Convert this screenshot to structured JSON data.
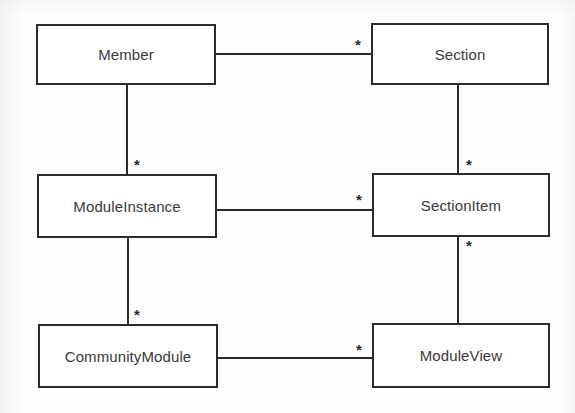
{
  "diagram": {
    "type": "uml-class-diagram",
    "background_color": "#fdfdfc",
    "line_color": "#2b2b2b",
    "text_color": "#3a3a3a",
    "classes": [
      {
        "id": "member",
        "name": "Member",
        "x": 36,
        "y": 24,
        "width": 180,
        "height": 61
      },
      {
        "id": "section",
        "name": "Section",
        "x": 371,
        "y": 23,
        "width": 178,
        "height": 62
      },
      {
        "id": "moduleinstance",
        "name": "ModuleInstance",
        "x": 37,
        "y": 174,
        "width": 180,
        "height": 64
      },
      {
        "id": "sectionitem",
        "name": "SectionItem",
        "x": 372,
        "y": 173,
        "width": 178,
        "height": 64
      },
      {
        "id": "communitymodule",
        "name": "CommunityModule",
        "x": 38,
        "y": 324,
        "width": 180,
        "height": 64
      },
      {
        "id": "moduleview",
        "name": "ModuleView",
        "x": 372,
        "y": 323,
        "width": 178,
        "height": 65
      }
    ],
    "associations": [
      {
        "id": "member-section",
        "from": "member",
        "to": "section",
        "orientation": "horizontal",
        "x": 216,
        "y": 53,
        "length": 156,
        "multiplicity_label": "*",
        "multiplicity_x": 358,
        "multiplicity_y": 44
      },
      {
        "id": "member-moduleinstance",
        "from": "member",
        "to": "moduleinstance",
        "orientation": "vertical",
        "x": 126,
        "y": 85,
        "length": 90,
        "multiplicity_label": "*",
        "multiplicity_x": 137,
        "multiplicity_y": 164
      },
      {
        "id": "section-sectionitem",
        "from": "section",
        "to": "sectionitem",
        "orientation": "vertical",
        "x": 457,
        "y": 85,
        "length": 89,
        "multiplicity_label": "*",
        "multiplicity_x": 469,
        "multiplicity_y": 164
      },
      {
        "id": "moduleinstance-sectionitem",
        "from": "moduleinstance",
        "to": "sectionitem",
        "orientation": "horizontal",
        "x": 217,
        "y": 209,
        "length": 156,
        "multiplicity_label": "*",
        "multiplicity_x": 359,
        "multiplicity_y": 199
      },
      {
        "id": "moduleinstance-communitymodule",
        "from": "moduleinstance",
        "to": "communitymodule",
        "orientation": "vertical",
        "x": 127,
        "y": 238,
        "length": 88,
        "multiplicity_label": "*",
        "multiplicity_x": 137,
        "multiplicity_y": 314
      },
      {
        "id": "sectionitem-moduleview",
        "from": "sectionitem",
        "to": "moduleview",
        "orientation": "vertical",
        "x": 457,
        "y": 237,
        "length": 88,
        "multiplicity_label": "*",
        "multiplicity_x": 469,
        "multiplicity_y": 245
      },
      {
        "id": "communitymodule-moduleview",
        "from": "communitymodule",
        "to": "moduleview",
        "orientation": "horizontal",
        "x": 218,
        "y": 357,
        "length": 155,
        "multiplicity_label": "*",
        "multiplicity_x": 359,
        "multiplicity_y": 349
      }
    ]
  }
}
